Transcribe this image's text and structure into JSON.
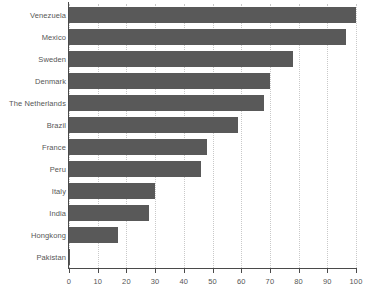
{
  "chart_data": {
    "type": "bar",
    "orientation": "horizontal",
    "title": "",
    "subtitle": "",
    "xlabel": "",
    "ylabel": "",
    "xlim": [
      0,
      100
    ],
    "ylim": null,
    "grid": "vertical-dotted",
    "legend": null,
    "legend_position": "none",
    "bar_color": "#595959",
    "axis_color": "#4a4a4a",
    "gridline_color": "#c9c9c9",
    "text_color": "#565656",
    "background": "#ffffff",
    "xticks": [
      0,
      10,
      20,
      30,
      40,
      50,
      60,
      70,
      80,
      90,
      100
    ],
    "xtick_labels": [
      "0",
      "10",
      "20",
      "30",
      "40",
      "50",
      "60",
      "70",
      "80",
      "90",
      "100"
    ],
    "categories": [
      "Venezuela",
      "Mexico",
      "Sweden",
      "Denmark",
      "The Netherlands",
      "Brazil",
      "France",
      "Peru",
      "Italy",
      "India",
      "Hongkong",
      "Pakistan"
    ],
    "values": [
      100,
      96.5,
      78,
      70,
      68,
      59,
      48,
      46,
      30,
      28,
      17,
      0.5
    ]
  }
}
